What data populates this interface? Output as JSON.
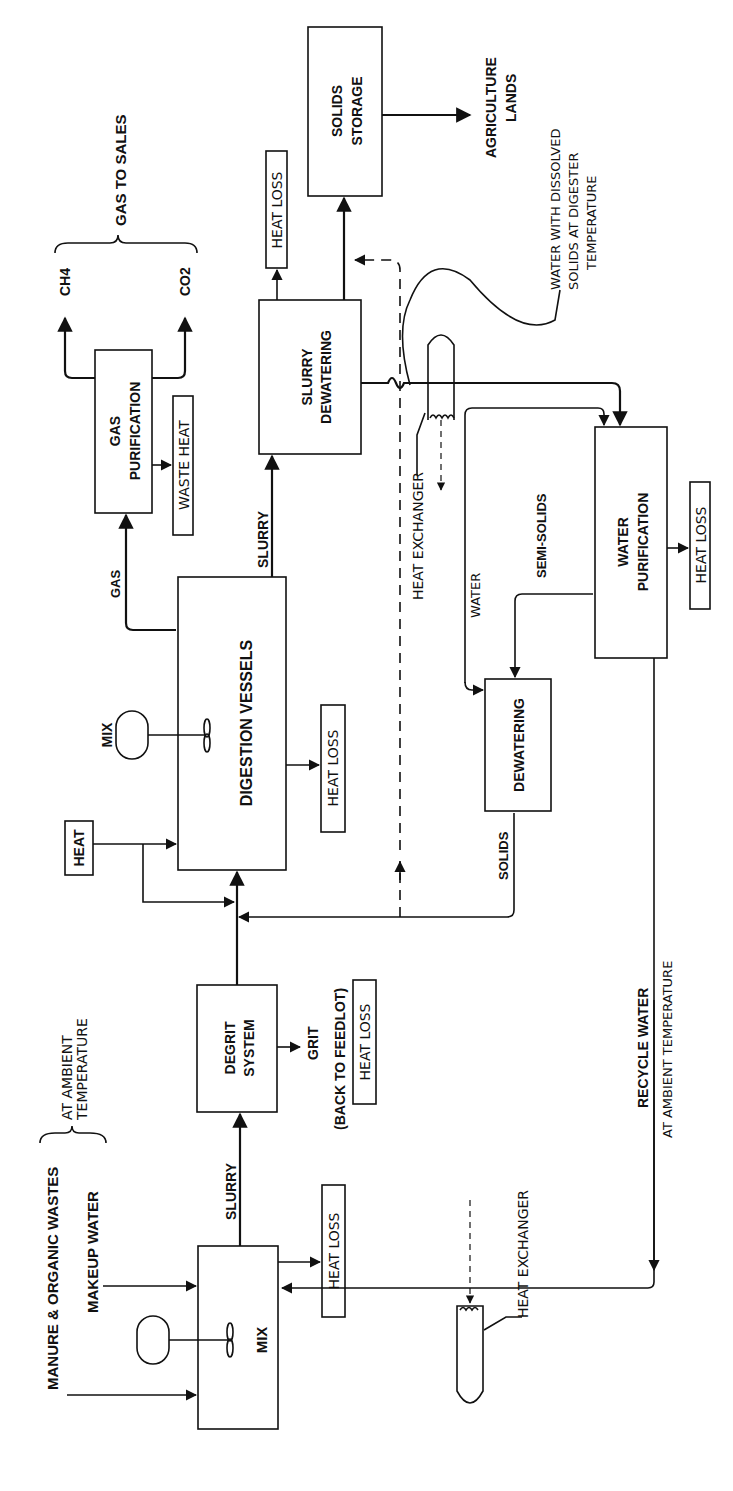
{
  "diagram": {
    "orientation": "rotated 90° counter-clockwise (text reads bottom-to-top)",
    "inputs": {
      "manure": "MANURE & ORGANIC WASTES",
      "makeup_water": "MAKEUP WATER",
      "ambient_line1": "AT AMBIENT",
      "ambient_line2": "TEMPERATURE"
    },
    "nodes": {
      "mix_tank": "MIX",
      "degrit_line1": "DEGRIT",
      "degrit_line2": "SYSTEM",
      "digestion": "DIGESTION  VESSELS",
      "digester_mixer": "MIX",
      "heat_source": "HEAT",
      "gas_purif_line1": "GAS",
      "gas_purif_line2": "PURIFICATION",
      "slurry_dew_line1": "SLURRY",
      "slurry_dew_line2": "DEWATERING",
      "solids_storage_line1": "SOLIDS",
      "solids_storage_line2": "STORAGE",
      "water_purif_line1": "WATER",
      "water_purif_line2": "PURIFICATION",
      "dewatering": "DEWATERING"
    },
    "outputs": {
      "ch4": "CH4",
      "co2": "CO2",
      "gas_to_sales": "GAS TO SALES",
      "agri_line1": "AGRICULTURE",
      "agri_line2": "LANDS",
      "grit": "GRIT",
      "grit_dest": "(BACK TO FEEDLOT)",
      "waste_heat": "WASTE HEAT"
    },
    "heat_loss_label": "HEAT LOSS",
    "flow_labels": {
      "slurry1": "SLURRY",
      "slurry2": "SLURRY",
      "gas": "GAS",
      "water": "WATER",
      "semi_solids": "SEMI-SOLIDS",
      "solids": "SOLIDS",
      "recycle_line1": "RECYCLE  WATER",
      "recycle_line2": "AT AMBIENT TEMPERATURE"
    },
    "annotations": {
      "heat_exchanger_1": "HEAT  EXCHANGER",
      "heat_exchanger_2": "HEAT  EXCHANGER",
      "dissolved_line1": "WATER WITH DISSOLVED",
      "dissolved_line2": "SOLIDS AT DIGESTER",
      "dissolved_line3": "TEMPERATURE"
    }
  }
}
